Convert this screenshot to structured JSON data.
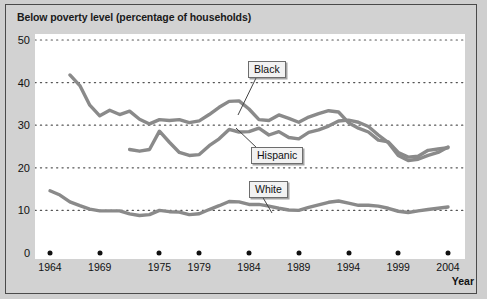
{
  "chart_data": {
    "type": "line",
    "title": "Below poverty level (percentage of households)",
    "xlabel": "Year",
    "ylabel": "",
    "xlim": [
      1964,
      2004
    ],
    "ylim": [
      0,
      50
    ],
    "grid": true,
    "gridlines_y": [
      0,
      10,
      20,
      30,
      40,
      50
    ],
    "legend_position": "inline-callouts",
    "y_ticks": [
      "0",
      "10",
      "20",
      "30",
      "40",
      "50"
    ],
    "x_ticks": [
      "1964",
      "1969",
      "1975",
      "1979",
      "1984",
      "1989",
      "1994",
      "1999",
      "2004"
    ],
    "x_tick_values": [
      1964,
      1969,
      1975,
      1979,
      1984,
      1989,
      1994,
      1999,
      2004
    ],
    "series": [
      {
        "name": "Black",
        "color": "#8a8a8a",
        "x": [
          1966,
          1967,
          1968,
          1969,
          1970,
          1971,
          1972,
          1973,
          1974,
          1975,
          1976,
          1977,
          1978,
          1979,
          1980,
          1981,
          1982,
          1983,
          1984,
          1985,
          1986,
          1987,
          1988,
          1989,
          1990,
          1991,
          1992,
          1993,
          1994,
          1995,
          1996,
          1997,
          1998,
          1999,
          2000,
          2001,
          2002,
          2003,
          2004
        ],
        "values": [
          41.8,
          39.3,
          34.7,
          32.2,
          33.5,
          32.5,
          33.3,
          31.4,
          30.3,
          31.3,
          31.1,
          31.3,
          30.6,
          31.0,
          32.5,
          34.2,
          35.6,
          35.7,
          33.8,
          31.3,
          31.1,
          32.4,
          31.6,
          30.7,
          31.9,
          32.7,
          33.4,
          33.1,
          30.6,
          29.3,
          28.4,
          26.5,
          26.1,
          23.6,
          22.5,
          22.7,
          24.1,
          24.4,
          24.7
        ],
        "label_text": "Black"
      },
      {
        "name": "Hispanic",
        "color": "#8a8a8a",
        "x": [
          1972,
          1973,
          1974,
          1975,
          1976,
          1977,
          1978,
          1979,
          1980,
          1981,
          1982,
          1983,
          1984,
          1985,
          1986,
          1987,
          1988,
          1989,
          1990,
          1991,
          1992,
          1993,
          1994,
          1995,
          1996,
          1997,
          1998,
          1999,
          2000,
          2001,
          2002,
          2003,
          2004
        ],
        "values": [
          24.3,
          23.9,
          24.3,
          28.6,
          26.0,
          23.6,
          22.9,
          23.1,
          25.2,
          26.8,
          29.0,
          28.4,
          28.5,
          29.3,
          27.7,
          28.5,
          27.1,
          26.8,
          28.3,
          28.9,
          29.8,
          31.0,
          31.2,
          30.7,
          29.7,
          27.7,
          25.9,
          22.9,
          21.7,
          22.0,
          22.9,
          23.6,
          24.9
        ],
        "label_text": "Hispanic"
      },
      {
        "name": "White",
        "color": "#8a8a8a",
        "x": [
          1964,
          1965,
          1966,
          1967,
          1968,
          1969,
          1970,
          1971,
          1972,
          1973,
          1974,
          1975,
          1976,
          1977,
          1978,
          1979,
          1980,
          1981,
          1982,
          1983,
          1984,
          1985,
          1986,
          1987,
          1988,
          1989,
          1990,
          1991,
          1992,
          1993,
          1994,
          1995,
          1996,
          1997,
          1998,
          1999,
          2000,
          2001,
          2002,
          2003,
          2004
        ],
        "values": [
          14.6,
          13.6,
          12.0,
          11.1,
          10.3,
          9.9,
          9.9,
          9.9,
          9.2,
          8.8,
          9.0,
          10.0,
          9.7,
          9.6,
          9.0,
          9.2,
          10.2,
          11.1,
          12.1,
          12.0,
          11.4,
          11.4,
          11.0,
          10.5,
          10.1,
          10.0,
          10.7,
          11.3,
          11.9,
          12.2,
          11.7,
          11.2,
          11.2,
          11.0,
          10.5,
          9.8,
          9.5,
          9.9,
          10.2,
          10.5,
          10.8
        ],
        "label_text": "White"
      }
    ]
  },
  "callouts": {
    "black": "Black",
    "hispanic": "Hispanic",
    "white": "White"
  },
  "colors": {
    "line": "#8a8a8a",
    "background": "#cfcfcf",
    "plot_background": "#ffffff",
    "grid": "#555555",
    "text": "#111111"
  }
}
